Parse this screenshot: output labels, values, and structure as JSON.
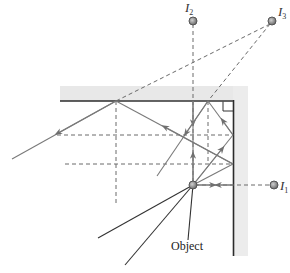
{
  "diagram": {
    "labels": {
      "object": "Object",
      "image1": "I",
      "image1_sub": "1",
      "image2": "I",
      "image2_sub": "2",
      "image3": "I",
      "image3_sub": "3"
    },
    "colors": {
      "mirror_line": "#2b2b2b",
      "mirror_shading": "#e6e6e6",
      "ray": "#7a7a7a",
      "dashed": "#6a6a6a",
      "point_fill": "#8a8a8a",
      "incoming_ray": "#333333"
    },
    "elements": [
      "horizontal-mirror",
      "vertical-mirror",
      "right-angle-mark",
      "object-point",
      "image-I1",
      "image-I2",
      "image-I3",
      "reflected-rays",
      "virtual-ray-extensions"
    ]
  }
}
